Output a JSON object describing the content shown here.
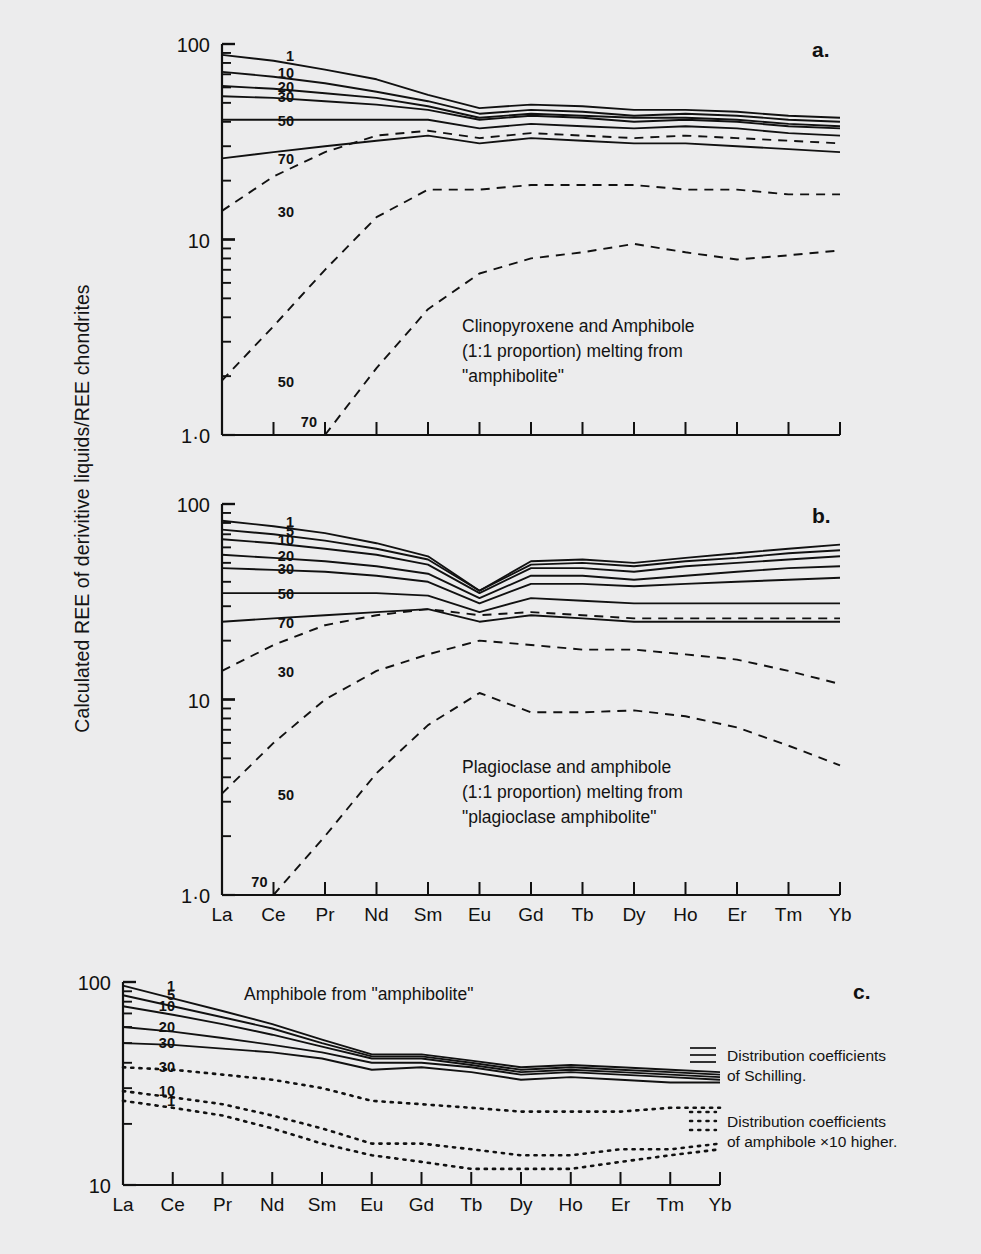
{
  "axis_title_y": "Calculated REE of derivitive liquids/REE chondrites",
  "elements": [
    "La",
    "Ce",
    "Pr",
    "Nd",
    "Sm",
    "Eu",
    "Gd",
    "Tb",
    "Dy",
    "Ho",
    "Er",
    "Tm",
    "Yb"
  ],
  "panels": {
    "a": {
      "letter": "a.",
      "caption_lines": [
        "Clinopyroxene and Amphibole",
        "(1:1 proportion) melting from",
        "\"amphibolite\""
      ],
      "y_ticks": [
        "100",
        "10",
        "1·0"
      ],
      "ylim": [
        1.0,
        100
      ],
      "solid_tags": [
        "1",
        "10",
        "20",
        "30",
        "50",
        "70"
      ],
      "dashed_tags": [
        "30",
        "50",
        "70"
      ]
    },
    "b": {
      "letter": "b.",
      "caption_lines": [
        "Plagioclase and amphibole",
        "(1:1 proportion) melting from",
        "\"plagioclase amphibolite\""
      ],
      "y_ticks": [
        "100",
        "10",
        "1·0"
      ],
      "ylim": [
        1.0,
        100
      ],
      "solid_tags": [
        "1",
        "5",
        "10",
        "20",
        "30",
        "50",
        "70"
      ],
      "dashed_tags": [
        "30",
        "50",
        "70"
      ]
    },
    "c": {
      "letter": "c.",
      "title": "Amphibole from \"amphibolite\"",
      "y_ticks": [
        "100",
        "10"
      ],
      "ylim": [
        10,
        100
      ],
      "solid_tags": [
        "1",
        "5",
        "10",
        "20",
        "30"
      ],
      "dotted_tags": [
        "30",
        "10",
        "1"
      ],
      "legend": [
        {
          "style": "solid",
          "lines": [
            "Distribution coefficients",
            "of Schilling."
          ]
        },
        {
          "style": "dotted",
          "lines": [
            "Distribution  coefficients",
            "of amphibole ×10 higher."
          ]
        }
      ]
    }
  },
  "chart_data": {
    "type": "line",
    "xlabel": "",
    "ylabel": "Calculated REE of derivitive liquids/REE chondrites",
    "x": [
      "La",
      "Ce",
      "Pr",
      "Nd",
      "Sm",
      "Eu",
      "Gd",
      "Tb",
      "Dy",
      "Ho",
      "Er",
      "Tm",
      "Yb"
    ],
    "grid": false,
    "yscale": "log",
    "panels": [
      {
        "id": "a",
        "label": "a.",
        "annotation": "Clinopyroxene and Amphibole (1:1 proportion) melting from \"amphibolite\"",
        "ylim": [
          1.0,
          100
        ],
        "series": [
          {
            "name": "1",
            "style": "solid",
            "values": [
              88,
              82,
              74,
              66,
              55,
              47,
              49,
              48,
              46,
              46,
              45,
              43,
              42
            ]
          },
          {
            "name": "10",
            "style": "solid",
            "values": [
              72,
              68,
              63,
              57,
              51,
              44,
              46,
              45,
              43,
              44,
              43,
              41,
              40
            ]
          },
          {
            "name": "20",
            "style": "solid",
            "values": [
              61,
              59,
              56,
              53,
              48,
              42,
              44,
              43,
              42,
              42,
              41,
              39,
              38
            ]
          },
          {
            "name": "30",
            "style": "solid",
            "values": [
              54,
              53,
              51,
              49,
              46,
              41,
              43,
              42,
              40,
              41,
              40,
              38,
              37
            ]
          },
          {
            "name": "50",
            "style": "solid",
            "values": [
              41,
              41,
              41,
              41,
              41,
              37,
              39,
              38,
              37,
              38,
              37,
              35,
              34
            ]
          },
          {
            "name": "70",
            "style": "solid",
            "values": [
              26,
              28,
              30,
              32,
              34,
              31,
              33,
              32,
              31,
              31,
              30,
              29,
              28
            ]
          },
          {
            "name": "30-dashed",
            "style": "dashed",
            "values": [
              14,
              21,
              28,
              34,
              36,
              33,
              35,
              34,
              33,
              34,
              33,
              32,
              31
            ]
          },
          {
            "name": "50-dashed",
            "style": "dashed",
            "values": [
              1.9,
              3.6,
              7.0,
              13,
              18,
              18,
              19,
              19,
              19,
              18,
              18,
              17,
              17
            ]
          },
          {
            "name": "70-dashed",
            "style": "dashed",
            "values": [
              null,
              null,
              1.0,
              2.2,
              4.4,
              6.7,
              8.0,
              8.6,
              9.5,
              8.6,
              7.9,
              8.3,
              8.8
            ]
          }
        ]
      },
      {
        "id": "b",
        "label": "b.",
        "annotation": "Plagioclase and amphibole (1:1 proportion) melting from \"plagioclase amphibolite\"",
        "ylim": [
          1.0,
          100
        ],
        "series": [
          {
            "name": "1",
            "style": "solid",
            "values": [
              82,
              77,
              71,
              63,
              54,
              36,
              51,
              52,
              50,
              53,
              56,
              59,
              62
            ]
          },
          {
            "name": "5",
            "style": "solid",
            "values": [
              74,
              70,
              65,
              59,
              52,
              36,
              49,
              50,
              48,
              51,
              53,
              56,
              58
            ]
          },
          {
            "name": "10",
            "style": "solid",
            "values": [
              66,
              63,
              59,
              55,
              49,
              35,
              47,
              47,
              45,
              48,
              50,
              52,
              54
            ]
          },
          {
            "name": "20",
            "style": "solid",
            "values": [
              55,
              53,
              51,
              48,
              44,
              33,
              43,
              43,
              41,
              43,
              45,
              47,
              48
            ]
          },
          {
            "name": "30",
            "style": "solid",
            "values": [
              47,
              46,
              45,
              43,
              40,
              31,
              39,
              39,
              38,
              39,
              40,
              41,
              42
            ]
          },
          {
            "name": "50",
            "style": "solid",
            "values": [
              35,
              35,
              35,
              35,
              34,
              28,
              33,
              32,
              31,
              31,
              31,
              31,
              31
            ]
          },
          {
            "name": "70",
            "style": "solid",
            "values": [
              25,
              26,
              27,
              28,
              29,
              25,
              27,
              26,
              25,
              25,
              25,
              25,
              25
            ]
          },
          {
            "name": "30-dashed",
            "style": "dashed",
            "values": [
              14,
              19,
              24,
              27,
              29,
              27,
              28,
              27,
              26,
              26,
              26,
              26,
              26
            ]
          },
          {
            "name": "50-dashed",
            "style": "dashed",
            "values": [
              3.3,
              6.0,
              10,
              14,
              17,
              20,
              19,
              18,
              18,
              17,
              16,
              14,
              12
            ]
          },
          {
            "name": "70-dashed",
            "style": "dashed",
            "values": [
              null,
              1.0,
              2.0,
              4.2,
              7.4,
              10.8,
              8.6,
              8.6,
              8.8,
              8.2,
              7.2,
              5.8,
              4.6
            ]
          }
        ]
      },
      {
        "id": "c",
        "label": "c.",
        "annotation": "Amphibole from \"amphibolite\"",
        "ylim": [
          10,
          100
        ],
        "series": [
          {
            "name": "1",
            "style": "solid",
            "values": [
              96,
              83,
              72,
              62,
              52,
              44,
              44,
              41,
              38,
              39,
              38,
              37,
              36
            ]
          },
          {
            "name": "5",
            "style": "solid",
            "values": [
              86,
              76,
              67,
              59,
              50,
              43,
              43,
              40,
              37,
              38,
              37,
              36,
              35
            ]
          },
          {
            "name": "10",
            "style": "solid",
            "values": [
              76,
              69,
              62,
              55,
              48,
              42,
              42,
              39,
              36,
              37,
              36,
              35,
              34
            ]
          },
          {
            "name": "20",
            "style": "solid",
            "values": [
              60,
              57,
              53,
              49,
              45,
              40,
              40,
              38,
              35,
              36,
              35,
              34,
              33
            ]
          },
          {
            "name": "30",
            "style": "solid",
            "values": [
              50,
              49,
              47,
              45,
              42,
              37,
              38,
              36,
              33,
              34,
              33,
              32,
              32
            ]
          },
          {
            "name": "30-dotted",
            "style": "dotted",
            "values": [
              38,
              37,
              35,
              33,
              30,
              26,
              25,
              24,
              23,
              23,
              23,
              24,
              24
            ]
          },
          {
            "name": "10-dotted",
            "style": "dotted",
            "values": [
              29,
              27,
              25,
              22,
              19,
              16,
              16,
              15,
              14,
              14,
              15,
              15,
              16
            ]
          },
          {
            "name": "1-dotted",
            "style": "dotted",
            "values": [
              26,
              24,
              22,
              19,
              16,
              14,
              13,
              12,
              12,
              12,
              13,
              14,
              15
            ]
          }
        ]
      }
    ]
  }
}
